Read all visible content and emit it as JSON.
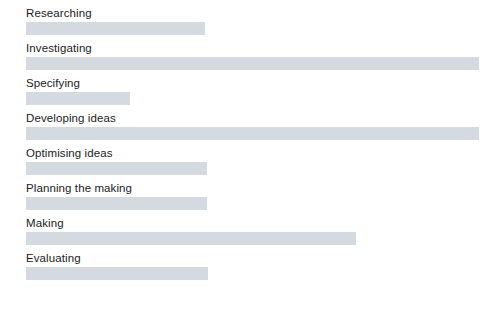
{
  "chart": {
    "type": "bar",
    "orientation": "horizontal",
    "title": "",
    "bar_color": "#d5dae0",
    "text_color": "#1b1b1b",
    "background": "#ffffff"
  },
  "chart_data": {
    "type": "bar",
    "title": "",
    "subtitle": "",
    "xlabel": "",
    "ylabel": "",
    "orientation": "horizontal",
    "grid": false,
    "legend": null,
    "axis_visible": false,
    "tick_labels": [],
    "xlim": [
      0,
      475
    ],
    "categories": [
      "Researching",
      "Investigating",
      "Specifying",
      "Developing ideas",
      "Optimising ideas",
      "Planning the making",
      "Making",
      "Evaluating"
    ],
    "values": [
      179,
      453,
      104,
      453,
      181,
      181,
      330,
      182
    ],
    "units": "px",
    "series": [
      {
        "name": "",
        "values": [
          179,
          453,
          104,
          453,
          181,
          181,
          330,
          182
        ]
      }
    ],
    "bars": [
      {
        "label": "Researching",
        "value": 179,
        "color": "#d5dae0"
      },
      {
        "label": "Investigating",
        "value": 453,
        "color": "#d5dae0"
      },
      {
        "label": "Specifying",
        "value": 104,
        "color": "#d5dae0"
      },
      {
        "label": "Developing ideas",
        "value": 453,
        "color": "#d5dae0"
      },
      {
        "label": "Optimising ideas",
        "value": 181,
        "color": "#d5dae0"
      },
      {
        "label": "Planning the making",
        "value": 181,
        "color": "#d5dae0"
      },
      {
        "label": "Making",
        "value": 330,
        "color": "#d5dae0"
      },
      {
        "label": "Evaluating",
        "value": 182,
        "color": "#d5dae0"
      }
    ]
  }
}
